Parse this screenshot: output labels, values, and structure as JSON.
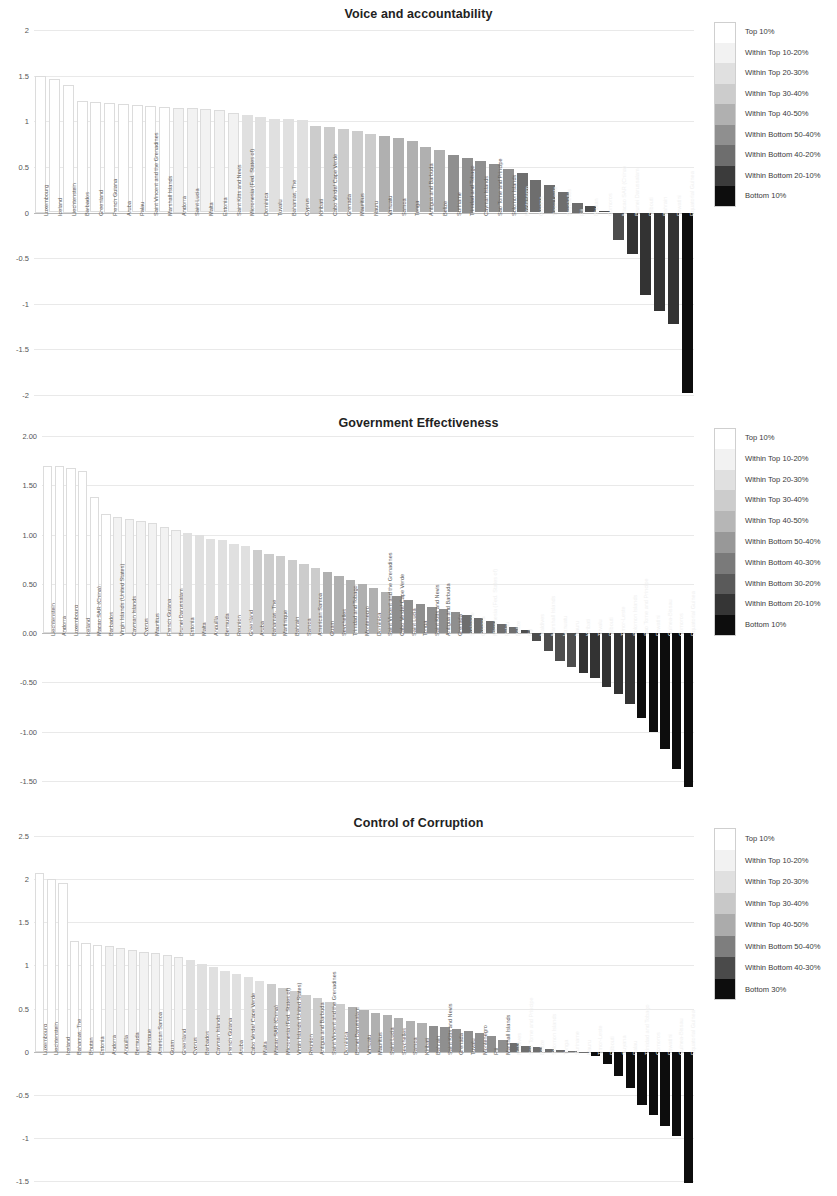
{
  "palette": {
    "top10": "#ffffff",
    "top10_20": "#f2f2f2",
    "top20_30": "#e0e0e0",
    "top30_40": "#cccccc",
    "top40_50": "#b0b0b0",
    "bot50_40": "#8f8f8f",
    "bot40_30": "#6e6e6e",
    "bot30_20": "#4d4d4d",
    "bot20_10": "#333333",
    "bottom10": "#0d0d0d",
    "bottom30": "#0d0d0d",
    "grid": "#e9e9e9",
    "axis": "#b9b9b9",
    "text": "#3a3a3a"
  },
  "charts": [
    {
      "id": "voice-and-accountability",
      "title": "Voice and accountability",
      "legend": [
        {
          "label": "Top 10%",
          "color": "#ffffff"
        },
        {
          "label": "Within Top 10-20%",
          "color": "#f2f2f2"
        },
        {
          "label": "Within Top 20-30%",
          "color": "#e0e0e0"
        },
        {
          "label": "Within Top 30-40%",
          "color": "#cccccc"
        },
        {
          "label": "Within Top 40-50%",
          "color": "#b0b0b0"
        },
        {
          "label": "Within Bottom 50-40%",
          "color": "#8f8f8f"
        },
        {
          "label": "Within Bottom 40-20%",
          "color": "#6e6e6e"
        },
        {
          "label": "Within Bottom 20-10%",
          "color": "#3b3b3b"
        },
        {
          "label": "Bottom 10%",
          "color": "#0d0d0d"
        }
      ],
      "chart_data": {
        "type": "bar",
        "title": "Voice and accountability",
        "xlabel": "",
        "ylabel": "",
        "ylim": [
          -2,
          2
        ],
        "yticks": [
          "2",
          "1.5",
          "1",
          "0.5",
          "0",
          "-0.5",
          "-1",
          "-1.5",
          "-2"
        ],
        "grid": true,
        "legend_position": "right",
        "categories": [
          "Luxembourg",
          "Iceland",
          "Liechtenstein",
          "Barbados",
          "Greenland",
          "French Guiana",
          "Aruba",
          "Palau",
          "Saint Vincent and the Grenadines",
          "Marshall Islands",
          "Andorra",
          "Saint Lucia",
          "Malta",
          "Estonia",
          "Saint Kitts and Nevis",
          "Micronesia (Fed. States of)",
          "Dominica",
          "Tuvalu",
          "Bahamas, The",
          "Cyprus",
          "Kiribati",
          "Cabo Verde/ Cape Verde",
          "Grenada",
          "Mauritius",
          "Nauru",
          "Vanuatu",
          "Samoa",
          "Tonga",
          "Antigua and Barbuda",
          "Belize",
          "Suriname",
          "Trinidad and Tobago",
          "Cayman Islands",
          "Sao Tome and Principe",
          "Solomon Islands",
          "Montenegro",
          "Guyana",
          "Timor-Leste",
          "Seychelles",
          "Fiji",
          "Bhutan",
          "Comoros",
          "Macao SAR (China)",
          "Brunei Darussalam",
          "Djibouti",
          "Bahrain",
          "Eswatini",
          "Equatorial Guinea"
        ],
        "values": [
          1.5,
          1.46,
          1.4,
          1.22,
          1.21,
          1.2,
          1.19,
          1.18,
          1.17,
          1.16,
          1.15,
          1.14,
          1.13,
          1.12,
          1.09,
          1.07,
          1.05,
          1.03,
          1.02,
          1.01,
          0.95,
          0.94,
          0.92,
          0.89,
          0.86,
          0.84,
          0.82,
          0.78,
          0.72,
          0.68,
          0.63,
          0.6,
          0.56,
          0.53,
          0.48,
          0.43,
          0.36,
          0.3,
          0.22,
          0.1,
          0.07,
          0.02,
          -0.3,
          -0.46,
          -0.9,
          -1.08,
          -1.22,
          -1.98
        ],
        "bins": [
          "top10",
          "top10",
          "top10",
          "top10",
          "top10",
          "top10",
          "top10",
          "top10",
          "top10",
          "top10",
          "top10_20",
          "top10_20",
          "top10_20",
          "top10_20",
          "top10_20",
          "top20_30",
          "top20_30",
          "top20_30",
          "top20_30",
          "top20_30",
          "top30_40",
          "top30_40",
          "top30_40",
          "top30_40",
          "top30_40",
          "top40_50",
          "top40_50",
          "top40_50",
          "top40_50",
          "top40_50",
          "bot50_40",
          "bot50_40",
          "bot50_40",
          "bot50_40",
          "bot50_40",
          "bot40_30",
          "bot40_30",
          "bot40_30",
          "bot40_30",
          "bot40_30",
          "bot30_20",
          "bot30_20",
          "bot30_20",
          "bot20_10",
          "bot20_10",
          "bot20_10",
          "bot20_10",
          "bottom10"
        ]
      }
    },
    {
      "id": "government-effectiveness",
      "title": "Government Effectiveness",
      "legend": [
        {
          "label": "Top 10%",
          "color": "#ffffff"
        },
        {
          "label": "Within Top 10-20%",
          "color": "#f2f2f2"
        },
        {
          "label": "Within Top 20-30%",
          "color": "#e0e0e0"
        },
        {
          "label": "Within Top 30-40%",
          "color": "#cccccc"
        },
        {
          "label": "Within Top 40-50%",
          "color": "#b6b6b6"
        },
        {
          "label": "Within Bottom 50-40%",
          "color": "#989898"
        },
        {
          "label": "Within Bottom 40-30%",
          "color": "#7a7a7a"
        },
        {
          "label": "Within Bottom 30-20%",
          "color": "#5a5a5a"
        },
        {
          "label": "Within Bottom 20-10%",
          "color": "#353535"
        },
        {
          "label": "Bottom 10%",
          "color": "#0d0d0d"
        }
      ],
      "chart_data": {
        "type": "bar",
        "title": "Government Effectiveness",
        "xlabel": "",
        "ylabel": "",
        "ylim": [
          -1.5,
          2.0
        ],
        "yticks": [
          "2.00",
          "1.50",
          "1.00",
          "0.50",
          "0.00",
          "-0.50",
          "-1.00",
          "-1.50"
        ],
        "grid": true,
        "legend_position": "right",
        "categories": [
          "Liechtenstein",
          "Andorra",
          "Luxembourg",
          "Iceland",
          "Macao SAR (China)",
          "Barbados",
          "Virgin Islands (United States)",
          "Cayman Islands",
          "Cyprus",
          "Mauritius",
          "French Guiana",
          "Brunei Darussalam",
          "Estonia",
          "Malta",
          "Anguilla",
          "Bermuda",
          "Reunion",
          "Greenland",
          "Aruba",
          "Bahamas, The",
          "Martinique",
          "Bahrain",
          "Samoa",
          "American Samoa",
          "Guam",
          "Seychelles",
          "Trinidad and Tobago",
          "Montenegro",
          "Dominica",
          "Saint Vincent and the Grenadines",
          "Cabo Verde/ Cape Verde",
          "Saint Lucia",
          "Tonga",
          "Saint Kitts and Nevis",
          "Antigua and Barbuda",
          "Grenada",
          "Suriname",
          "Guyana",
          "Micronesia (Fed. States of)",
          "Palau",
          "Belize",
          "Fiji",
          "Maldives",
          "Marshall Islands",
          "Vanuatu",
          "Nauru",
          "Kiribati",
          "Tuvalu",
          "Djibouti",
          "Timor-Leste",
          "Solomon Islands",
          "Sao Tome and Principe",
          "Eswatini",
          "Guinea-Bissau",
          "Comoros",
          "Equatorial Guinea"
        ],
        "values": [
          1.7,
          1.7,
          1.68,
          1.65,
          1.38,
          1.21,
          1.18,
          1.16,
          1.14,
          1.12,
          1.08,
          1.05,
          1.02,
          1.0,
          0.96,
          0.94,
          0.9,
          0.88,
          0.84,
          0.8,
          0.78,
          0.74,
          0.7,
          0.66,
          0.62,
          0.58,
          0.54,
          0.5,
          0.46,
          0.42,
          0.38,
          0.34,
          0.3,
          0.27,
          0.24,
          0.21,
          0.18,
          0.15,
          0.12,
          0.09,
          0.06,
          0.03,
          -0.08,
          -0.18,
          -0.28,
          -0.34,
          -0.4,
          -0.46,
          -0.55,
          -0.62,
          -0.72,
          -0.86,
          -1.0,
          -1.18,
          -1.38,
          -1.56
        ],
        "bins": [
          "top10",
          "top10",
          "top10",
          "top10",
          "top10",
          "top10",
          "top10_20",
          "top10_20",
          "top10_20",
          "top10_20",
          "top10_20",
          "top10_20",
          "top20_30",
          "top20_30",
          "top20_30",
          "top20_30",
          "top20_30",
          "top20_30",
          "top30_40",
          "top30_40",
          "top30_40",
          "top30_40",
          "top30_40",
          "top30_40",
          "top40_50",
          "top40_50",
          "top40_50",
          "top40_50",
          "top40_50",
          "top40_50",
          "bot50_40",
          "bot50_40",
          "bot50_40",
          "bot50_40",
          "bot50_40",
          "bot50_40",
          "bot40_30",
          "bot40_30",
          "bot40_30",
          "bot40_30",
          "bot40_30",
          "bot30_20",
          "bot30_20",
          "bot30_20",
          "bot30_20",
          "bot30_20",
          "bot20_10",
          "bot20_10",
          "bot20_10",
          "bot20_10",
          "bot20_10",
          "bottom10",
          "bottom10",
          "bottom10",
          "bottom10",
          "bottom10"
        ]
      }
    },
    {
      "id": "control-of-corruption",
      "title": "Control of Corruption",
      "legend": [
        {
          "label": "Top 10%",
          "color": "#ffffff"
        },
        {
          "label": "Within Top 10-20%",
          "color": "#f2f2f2"
        },
        {
          "label": "Within Top 20-30%",
          "color": "#e0e0e0"
        },
        {
          "label": "Within Top 30-40%",
          "color": "#c8c8c8"
        },
        {
          "label": "Within Top 40-50%",
          "color": "#ababab"
        },
        {
          "label": "Within Bottom 50-40%",
          "color": "#7e7e7e"
        },
        {
          "label": "Within Bottom 40-30%",
          "color": "#4a4a4a"
        },
        {
          "label": "Bottom 30%",
          "color": "#0d0d0d"
        }
      ],
      "chart_data": {
        "type": "bar",
        "title": "Control of Corruption",
        "xlabel": "",
        "ylabel": "",
        "ylim": [
          -1.5,
          2.5
        ],
        "yticks": [
          "2.5",
          "2",
          "1.5",
          "1",
          "0.5",
          "0",
          "-0.5",
          "-1",
          "-1.5"
        ],
        "grid": true,
        "legend_position": "right",
        "categories": [
          "Luxembourg",
          "Liechtenstein",
          "Iceland",
          "Bahamas, The",
          "Bhutan",
          "Estonia",
          "Andorra",
          "Anguilla",
          "Bermuda",
          "Martinique",
          "American Samoa",
          "Guam",
          "Greenland",
          "Cyprus",
          "Barbados",
          "Cayman Islands",
          "French Guiana",
          "Aruba",
          "Cabo Verde/ Cape Verde",
          "Malta",
          "Macao SAR (China)",
          "Micronesia (Fed. States of)",
          "Virgin Islands (United States)",
          "Reunion",
          "Antigua and Barbuda",
          "Saint Vincent and the Grenadines",
          "Dominica",
          "Brunei Darussalam",
          "Vanuatu",
          "Mauritius",
          "Saint Lucia",
          "Seychelles",
          "Samoa",
          "Kiribati",
          "Bahrain",
          "Saint Kitts and Nevis",
          "Grenada",
          "Tuvalu",
          "Montenegro",
          "Fiji",
          "Marshall Islands",
          "Maldives",
          "Sao Tome and Principe",
          "Belize",
          "Solomon Islands",
          "Tonga",
          "Suriname",
          "Nauru",
          "Timor-Leste",
          "Djibouti",
          "Guyana",
          "Palau",
          "Trinidad and Tobago",
          "Comoros",
          "Eswatini",
          "Guinea-Bissau",
          "Equatorial Guinea"
        ],
        "values": [
          2.07,
          2.0,
          1.95,
          1.28,
          1.26,
          1.24,
          1.22,
          1.2,
          1.18,
          1.16,
          1.14,
          1.12,
          1.1,
          1.06,
          1.02,
          0.98,
          0.94,
          0.9,
          0.86,
          0.82,
          0.78,
          0.74,
          0.7,
          0.66,
          0.62,
          0.58,
          0.55,
          0.52,
          0.48,
          0.45,
          0.42,
          0.39,
          0.36,
          0.33,
          0.3,
          0.28,
          0.26,
          0.24,
          0.22,
          0.18,
          0.14,
          0.1,
          0.07,
          0.05,
          0.03,
          0.02,
          0.01,
          0.0,
          -0.05,
          -0.14,
          -0.28,
          -0.42,
          -0.62,
          -0.74,
          -0.86,
          -0.98,
          -1.52
        ],
        "bins": [
          "top10",
          "top10",
          "top10",
          "top10",
          "top10",
          "top10",
          "top10_20",
          "top10_20",
          "top10_20",
          "top10_20",
          "top10_20",
          "top10_20",
          "top10_20",
          "top20_30",
          "top20_30",
          "top20_30",
          "top20_30",
          "top20_30",
          "top20_30",
          "top20_30",
          "top30_40",
          "top30_40",
          "top30_40",
          "top30_40",
          "top30_40",
          "top30_40",
          "top30_40",
          "top40_50",
          "top40_50",
          "top40_50",
          "top40_50",
          "top40_50",
          "top40_50",
          "top40_50",
          "bot50_40",
          "bot50_40",
          "bot50_40",
          "bot50_40",
          "bot50_40",
          "bot50_40",
          "bot50_40",
          "bot40_30",
          "bot40_30",
          "bot40_30",
          "bot40_30",
          "bot40_30",
          "bot40_30",
          "bot40_30",
          "bottom30",
          "bottom30",
          "bottom30",
          "bottom30",
          "bottom30",
          "bottom30",
          "bottom30",
          "bottom30",
          "bottom30"
        ]
      }
    }
  ]
}
